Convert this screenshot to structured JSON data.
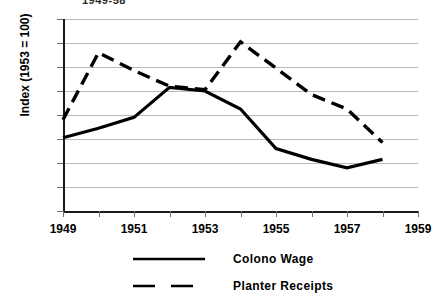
{
  "clipped_title": "1949-58",
  "chart_data": {
    "type": "line",
    "title": "",
    "xlabel": "",
    "ylabel": "Index (1953 = 100)",
    "xlim": [
      1949,
      1959
    ],
    "ylim": [
      0,
      160
    ],
    "yticks": [
      0,
      20,
      40,
      60,
      80,
      100,
      120,
      140,
      160
    ],
    "xticks": [
      1949,
      1950,
      1951,
      1952,
      1953,
      1954,
      1955,
      1956,
      1957,
      1958,
      1959
    ],
    "xtick_labels": [
      "1949",
      "1951",
      "1953",
      "1955",
      "1957",
      "1959"
    ],
    "xtick_labelled_values": [
      1949,
      1951,
      1953,
      1955,
      1957,
      1959
    ],
    "grid": true,
    "legend_position": "bottom",
    "x": [
      1949,
      1950,
      1951,
      1952,
      1953,
      1954,
      1955,
      1956,
      1957,
      1958
    ],
    "series": [
      {
        "name": "Colono Wage",
        "style": "solid",
        "color": "#000000",
        "values": [
          61,
          69,
          78,
          103,
          100,
          85,
          52,
          43,
          36,
          43
        ]
      },
      {
        "name": "Planter Receipts",
        "style": "dashed",
        "color": "#000000",
        "values": [
          76,
          132,
          117,
          104,
          101,
          141,
          119,
          97,
          85,
          57
        ]
      }
    ]
  },
  "legend": {
    "items": [
      {
        "label": "Colono Wage",
        "style": "solid"
      },
      {
        "label": "Planter Receipts",
        "style": "dashed"
      }
    ]
  }
}
